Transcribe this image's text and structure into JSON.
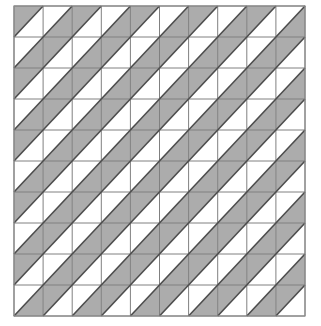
{
  "figure": {
    "width_px": 321,
    "height_px": 326
  },
  "grid": {
    "rows": 10,
    "columns": 10,
    "cell_count": 100,
    "origin_x": 14,
    "origin_y": 6,
    "cell_width": 29.1,
    "cell_height": 31.0,
    "diagonal_direction": "bottom-left-to-top-right"
  },
  "style": {
    "background_color": "#ffffff",
    "shaded_triangle_color": "#acacac",
    "unshaded_triangle_color": "#ffffff",
    "cell_border_color": "#808080",
    "diagonal_line_color": "#4d4d4d",
    "outer_border_color": "#8c8c8c",
    "cell_border_width": 1,
    "diagonal_line_width": 1.6,
    "outer_border_width": 1.2
  },
  "legend": {
    "shaded_half_label": "upper-left triangle shaded",
    "unshaded_half_label": "lower-right triangle shaded",
    "rule": "cell (row + column) even -> upper-left half shaded; odd -> lower-right half shaded"
  },
  "chart_data": {
    "type": "heatmap",
    "xlabel": "",
    "ylabel": "",
    "rows": 10,
    "columns": 10,
    "value_meaning": "0 = upper-left triangle of the cell is shaded gray; 1 = lower-right triangle of the cell is shaded gray",
    "categories": [
      "c1",
      "c2",
      "c3",
      "c4",
      "c5",
      "c6",
      "c7",
      "c8",
      "c9",
      "c10"
    ],
    "row_labels": [
      "r1",
      "r2",
      "r3",
      "r4",
      "r5",
      "r6",
      "r7",
      "r8",
      "r9",
      "r10"
    ],
    "values": [
      [
        0,
        1,
        0,
        1,
        0,
        1,
        0,
        1,
        0,
        1
      ],
      [
        1,
        0,
        1,
        0,
        1,
        0,
        1,
        0,
        1,
        0
      ],
      [
        0,
        1,
        0,
        1,
        0,
        1,
        0,
        1,
        0,
        1
      ],
      [
        1,
        0,
        1,
        0,
        1,
        0,
        1,
        0,
        1,
        0
      ],
      [
        0,
        1,
        0,
        1,
        0,
        1,
        0,
        1,
        0,
        1
      ],
      [
        1,
        0,
        1,
        0,
        1,
        0,
        1,
        0,
        1,
        0
      ],
      [
        0,
        1,
        0,
        1,
        0,
        1,
        0,
        1,
        0,
        1
      ],
      [
        1,
        0,
        1,
        0,
        1,
        0,
        1,
        0,
        1,
        0
      ],
      [
        0,
        1,
        0,
        1,
        0,
        1,
        0,
        1,
        0,
        1
      ],
      [
        1,
        0,
        1,
        0,
        1,
        0,
        1,
        0,
        1,
        0
      ]
    ],
    "colors": {
      "0": "#acacac",
      "1": "#acacac"
    },
    "grid": true,
    "legend": "none"
  }
}
